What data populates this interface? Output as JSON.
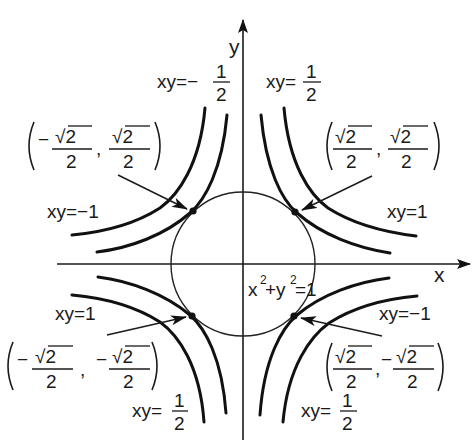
{
  "figure": {
    "axes": {
      "x_label": "x",
      "y_label": "y"
    },
    "circle": {
      "equation": "x² + y² = 1",
      "label_main": "x",
      "label_plus": "+y",
      "label_eq": "=1",
      "sup": "2"
    },
    "hyperbola_labels": {
      "top_left": {
        "lhs": "xy=−",
        "num": "1",
        "den": "2",
        "text": "xy = −1/2"
      },
      "top_right": {
        "lhs": "xy=",
        "num": "1",
        "den": "2",
        "text": "xy = 1/2"
      },
      "left_upper": {
        "lhs": "xy=−1",
        "text": "xy = −1"
      },
      "right_upper": {
        "lhs": "xy=1",
        "text": "xy = 1"
      },
      "left_lower": {
        "lhs": "xy=1",
        "text": "xy = 1"
      },
      "right_lower": {
        "lhs": "xy=−1",
        "text": "xy = −1"
      },
      "bottom_left": {
        "lhs": "xy=",
        "num": "1",
        "den": "2",
        "text": "xy = 1/2"
      },
      "bottom_right": {
        "lhs": "xy=",
        "num": "1",
        "den": "2",
        "text": "xy = 1/2"
      }
    },
    "points": [
      {
        "name": "upper-left",
        "x_sign": "−",
        "y_sign": "",
        "num": "√2",
        "den": "2",
        "text": "(−√2/2, √2/2)"
      },
      {
        "name": "upper-right",
        "x_sign": "",
        "y_sign": "",
        "num": "√2",
        "den": "2",
        "text": "(√2/2, √2/2)"
      },
      {
        "name": "lower-left",
        "x_sign": "−",
        "y_sign": "−",
        "num": "√2",
        "den": "2",
        "text": "(−√2/2, −√2/2)"
      },
      {
        "name": "lower-right",
        "x_sign": "",
        "y_sign": "−",
        "num": "√2",
        "den": "2",
        "text": "(√2/2, −√2/2)"
      }
    ],
    "comma": ",",
    "colors": {
      "ink": "#111111",
      "background": "#ffffff"
    }
  }
}
